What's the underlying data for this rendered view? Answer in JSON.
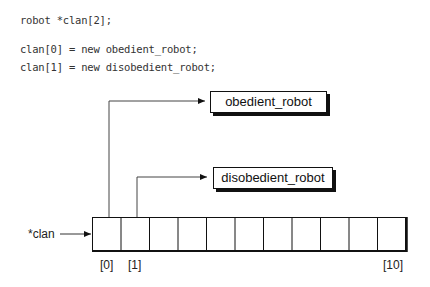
{
  "code": {
    "line1": "robot *clan[2];",
    "line2": "clan[0] = new obedient_robot;",
    "line3": "clan[1] = new disobedient_robot;"
  },
  "diagram": {
    "boxes": {
      "obedient": "obedient_robot",
      "disobedient": "disobedient_robot"
    },
    "pointer_label": "*clan",
    "array_cells": 11,
    "indices": {
      "first": "[0]",
      "second": "[1]",
      "last": "[10]"
    }
  }
}
